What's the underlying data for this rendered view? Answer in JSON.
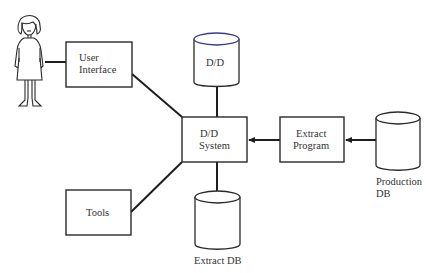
{
  "diagram": {
    "nodes": {
      "user": {
        "type": "person",
        "name": "user-figure"
      },
      "user_interface": {
        "label_line1": "User",
        "label_line2": "Interface",
        "shape": "box"
      },
      "dd_store": {
        "label": "D/D",
        "shape": "cylinder"
      },
      "dd_system": {
        "label_line1": "D/D",
        "label_line2": "System",
        "shape": "box"
      },
      "extract_program": {
        "label_line1": "Extract",
        "label_line2": "Program",
        "shape": "box"
      },
      "production_db": {
        "label_line1": "Production",
        "label_line2": "DB",
        "shape": "cylinder"
      },
      "tools": {
        "label": "Tools",
        "shape": "box"
      },
      "extract_db": {
        "label": "Extract DB",
        "shape": "cylinder"
      }
    },
    "edges": [
      {
        "from": "user",
        "to": "user_interface",
        "arrow": false
      },
      {
        "from": "user_interface",
        "to": "dd_system",
        "arrow": false
      },
      {
        "from": "dd_store",
        "to": "dd_system",
        "arrow": false
      },
      {
        "from": "extract_program",
        "to": "dd_system",
        "arrow": true
      },
      {
        "from": "production_db",
        "to": "extract_program",
        "arrow": true
      },
      {
        "from": "tools",
        "to": "dd_system",
        "arrow": false
      },
      {
        "from": "dd_system",
        "to": "extract_db",
        "arrow": false
      }
    ],
    "colors": {
      "stroke": "#2a2a2a",
      "text": "#333333",
      "background": "#ffffff"
    }
  }
}
